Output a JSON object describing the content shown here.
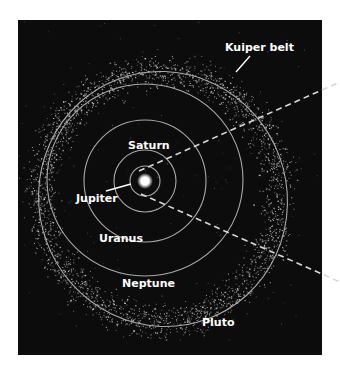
{
  "figure": {
    "background": "#ffffff",
    "panel": {
      "x": 18,
      "y": 20,
      "width": 304,
      "height": 335,
      "color": "#0c0c0c"
    },
    "sun": {
      "cx": 145,
      "cy": 181,
      "r": 4,
      "color": "#ffffff"
    },
    "orbit_color": "#a9a9a9"
  },
  "orbits": [
    {
      "name": "Jupiter",
      "cx": 145,
      "cy": 181,
      "rx": 15,
      "ry": 15,
      "rotate": 0
    },
    {
      "name": "Saturn",
      "cx": 145,
      "cy": 181,
      "rx": 31,
      "ry": 31,
      "rotate": 0
    },
    {
      "name": "Uranus",
      "cx": 145,
      "cy": 181,
      "rx": 61,
      "ry": 61,
      "rotate": 0
    },
    {
      "name": "Neptune",
      "cx": 145,
      "cy": 180,
      "rx": 98,
      "ry": 96,
      "rotate": 0
    },
    {
      "name": "Pluto",
      "cx": 163,
      "cy": 199,
      "rx": 124,
      "ry": 128,
      "rotate": -20
    }
  ],
  "labels": [
    {
      "id": "kuiper-belt",
      "text": "Kuiper belt",
      "x": 225,
      "y": 51
    },
    {
      "id": "saturn",
      "text": "Saturn",
      "x": 128,
      "y": 149
    },
    {
      "id": "jupiter",
      "text": "Jupiter",
      "x": 76,
      "y": 202
    },
    {
      "id": "uranus",
      "text": "Uranus",
      "x": 99,
      "y": 242
    },
    {
      "id": "neptune",
      "text": "Neptune",
      "x": 122,
      "y": 287
    },
    {
      "id": "pluto",
      "text": "Pluto",
      "x": 202,
      "y": 326
    }
  ],
  "pointers": [
    {
      "id": "kuiper-pointer",
      "x1": 250,
      "y1": 56,
      "x2": 236,
      "y2": 72
    },
    {
      "id": "jupiter-pointer",
      "x1": 106,
      "y1": 191,
      "x2": 131,
      "y2": 184
    }
  ],
  "dashed_lines": [
    {
      "id": "upper-sightline",
      "x1": 139,
      "y1": 171,
      "x2": 340,
      "y2": 82
    },
    {
      "id": "lower-sightline",
      "x1": 141,
      "y1": 194,
      "x2": 340,
      "y2": 282
    }
  ],
  "kuiper_belt": {
    "cx": 160,
    "cy": 196,
    "inner_r": 100,
    "outer_r": 150,
    "count": 2600,
    "seed": 7,
    "dot_color": "#cfcfcf"
  }
}
